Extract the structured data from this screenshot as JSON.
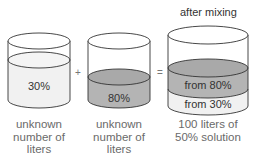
{
  "title": "after mixing",
  "operators": {
    "plus": "+",
    "equals": "="
  },
  "colors": {
    "outline": "#333333",
    "light_fill": "#f1f1f1",
    "dark_fill": "#b4b4b4",
    "dark_top": "#a8a8a8",
    "caption": "#6a6a6a"
  },
  "containers": [
    {
      "label": "30%",
      "caption_lines": [
        "unknown",
        "number of",
        "liters"
      ]
    },
    {
      "label": "80%",
      "caption_lines": [
        "unknown",
        "number of",
        "liters"
      ]
    },
    {
      "layers": [
        {
          "label": "from 80%"
        },
        {
          "label": "from 30%"
        }
      ],
      "caption_lines": [
        "100 liters of",
        "50% solution"
      ]
    }
  ]
}
